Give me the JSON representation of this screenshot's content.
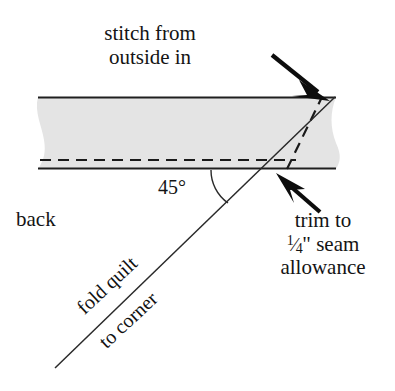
{
  "figure": {
    "canvas": {
      "width": 395,
      "height": 391
    },
    "colors": {
      "background": "#ffffff",
      "fabric_fill": "#e4e4e4",
      "line": "#1a1a1a",
      "text": "#141414"
    }
  },
  "labels": {
    "stitch_line1": "stitch from",
    "stitch_line2": "outside in",
    "back": "back",
    "angle": "45°",
    "trim_line1": "trim to",
    "trim_fraction_numerator": "1",
    "trim_fraction_slash": "⁄",
    "trim_fraction_denominator": "4",
    "trim_inch_mark": "\"",
    "trim_line2_rest": " seam",
    "trim_line3": "allowance",
    "fold_quilt": "fold quilt",
    "to_corner": "to corner"
  },
  "icons": {
    "arrow_top": "arrow-down-right-icon",
    "arrow_bottom": "arrow-up-left-icon",
    "angle_arc": "angle-arc-icon"
  },
  "geometry": {
    "band_top_y": 97,
    "band_bottom_y": 169,
    "band_left_x": 38,
    "band_right_x": 336,
    "stitch_dashed_y": 160,
    "diagonal_start": [
      55,
      368
    ],
    "diagonal_end": [
      335,
      97
    ],
    "angle_degrees": 45
  }
}
